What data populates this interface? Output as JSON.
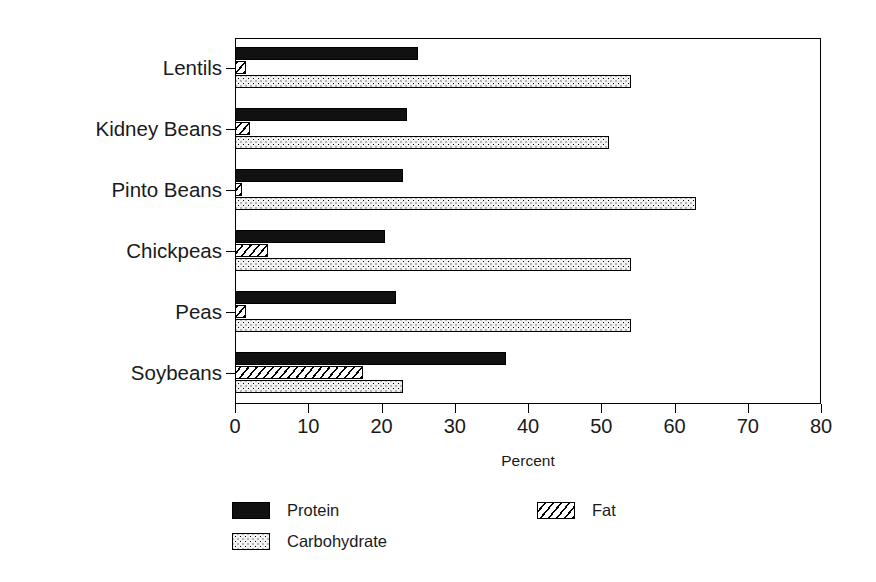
{
  "chart_data": {
    "type": "bar",
    "orientation": "horizontal",
    "grouped": true,
    "title": "",
    "xlabel": "Percent",
    "ylabel": "",
    "xlim": [
      0,
      80
    ],
    "xticks": [
      0,
      10,
      20,
      30,
      40,
      50,
      60,
      70,
      80
    ],
    "xtick_labels": [
      "0",
      "10",
      "20",
      "30",
      "40",
      "50",
      "60",
      "70",
      "80"
    ],
    "grid": false,
    "legend_position": "below-plot",
    "categories": [
      "Lentils",
      "Kidney Beans",
      "Pinto Beans",
      "Chickpeas",
      "Peas",
      "Soybeans"
    ],
    "series": [
      {
        "name": "Protein",
        "fill": "solid-black",
        "values": [
          25,
          23.5,
          23,
          20.5,
          22,
          37
        ]
      },
      {
        "name": "Fat",
        "fill": "diagonal-hatch",
        "values": [
          1.5,
          2,
          1,
          4.5,
          1.5,
          17.5
        ]
      },
      {
        "name": "Carbohydrate",
        "fill": "dotted-stipple",
        "values": [
          54,
          51,
          63,
          54,
          54,
          23
        ]
      }
    ]
  },
  "colors": {
    "axis": "#000000",
    "background": "#ffffff",
    "protein": "#111111",
    "fat": "#ffffff",
    "carbohydrate": "#f2f2f2"
  }
}
